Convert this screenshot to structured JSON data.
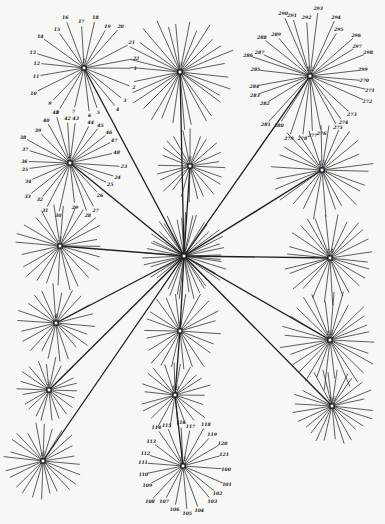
{
  "diagram": {
    "title": "",
    "background": "#f7f7f5",
    "ink": "#222222",
    "center": {
      "id": "center",
      "label": "",
      "x": 184,
      "y": 256,
      "rays": 44,
      "length": 42
    },
    "clusters": [
      {
        "id": "c1",
        "label": "1",
        "x": 84,
        "y": 68,
        "rays": 22,
        "length": 50,
        "leaf_labels": [
          "1",
          "2",
          "3",
          "4",
          "5",
          "6",
          "7",
          "8",
          "9",
          "10",
          "11",
          "12",
          "13",
          "14",
          "15",
          "16",
          "17",
          "18",
          "19",
          "20",
          "21",
          "22"
        ]
      },
      {
        "id": "c7",
        "label": "7",
        "x": 180,
        "y": 72,
        "rays": 30,
        "length": 55,
        "leaf_labels": []
      },
      {
        "id": "c12",
        "label": "12",
        "x": 310,
        "y": 76,
        "rays": 30,
        "length": 60,
        "leaf_labels": [
          "270",
          "271",
          "272",
          "273",
          "274",
          "275",
          "276",
          "277",
          "278",
          "279",
          "280",
          "281",
          "282",
          "283",
          "284",
          "285",
          "286",
          "287",
          "288",
          "289",
          "290",
          "291",
          "292",
          "293",
          "294",
          "295",
          "296",
          "297",
          "298",
          "299"
        ]
      },
      {
        "id": "c2",
        "label": "2",
        "x": 70,
        "y": 163,
        "rays": 26,
        "length": 48,
        "leaf_labels": [
          "23",
          "24",
          "25",
          "26",
          "27",
          "28",
          "29",
          "30",
          "31",
          "32",
          "33",
          "34",
          "35",
          "36",
          "37",
          "38",
          "39",
          "40",
          "41",
          "42",
          "43",
          "44",
          "45",
          "46",
          "47",
          "48"
        ]
      },
      {
        "id": "c8",
        "label": "8",
        "x": 190,
        "y": 166,
        "rays": 24,
        "length": 36,
        "leaf_labels": []
      },
      {
        "id": "c13",
        "label": "13",
        "x": 322,
        "y": 170,
        "rays": 26,
        "length": 50,
        "leaf_labels": []
      },
      {
        "id": "c3",
        "label": "3",
        "x": 60,
        "y": 246,
        "rays": 24,
        "length": 46,
        "leaf_labels": []
      },
      {
        "id": "c14",
        "label": "14",
        "x": 330,
        "y": 258,
        "rays": 26,
        "length": 46,
        "leaf_labels": []
      },
      {
        "id": "c4",
        "label": "4",
        "x": 56,
        "y": 323,
        "rays": 22,
        "length": 38,
        "leaf_labels": []
      },
      {
        "id": "c9",
        "label": "9",
        "x": 180,
        "y": 331,
        "rays": 22,
        "length": 42,
        "leaf_labels": []
      },
      {
        "id": "c15",
        "label": "15",
        "x": 330,
        "y": 340,
        "rays": 28,
        "length": 48,
        "leaf_labels": []
      },
      {
        "id": "c5",
        "label": "5",
        "x": 49,
        "y": 390,
        "rays": 22,
        "length": 32,
        "leaf_labels": []
      },
      {
        "id": "c10",
        "label": "10",
        "x": 175,
        "y": 395,
        "rays": 22,
        "length": 36,
        "leaf_labels": []
      },
      {
        "id": "c16",
        "label": "16",
        "x": 332,
        "y": 406,
        "rays": 26,
        "length": 40,
        "leaf_labels": []
      },
      {
        "id": "c6",
        "label": "6",
        "x": 43,
        "y": 461,
        "rays": 24,
        "length": 38,
        "leaf_labels": []
      },
      {
        "id": "c11",
        "label": "11",
        "x": 183,
        "y": 466,
        "rays": 22,
        "length": 42,
        "leaf_labels": [
          "100",
          "101",
          "102",
          "103",
          "104",
          "105",
          "106",
          "107",
          "108",
          "109",
          "110",
          "111",
          "112",
          "113",
          "114",
          "115",
          "116",
          "117",
          "118",
          "119",
          "120",
          "121"
        ]
      }
    ],
    "links": [
      "c1",
      "c7",
      "c12",
      "c2",
      "c13",
      "c3",
      "c14",
      "c4",
      "c9",
      "c15",
      "c5",
      "c16",
      "c6"
    ],
    "chain_links": [
      [
        "c8",
        "center"
      ],
      [
        "c9",
        "c10"
      ],
      [
        "c10",
        "c11"
      ]
    ]
  }
}
